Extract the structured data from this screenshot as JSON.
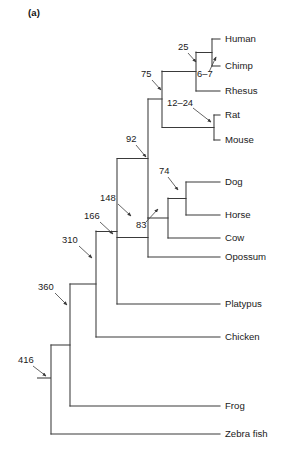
{
  "figure": {
    "panel_label": "(a)",
    "type": "phylogenetic-tree",
    "stroke_color": "#3a3a3a",
    "text_color": "#1a1a1a",
    "background": "#ffffff"
  },
  "tips": [
    {
      "id": "human",
      "label": "Human",
      "x": 225,
      "y": 39,
      "branch_x": 212
    },
    {
      "id": "chimp",
      "label": "Chimp",
      "x": 225,
      "y": 66,
      "branch_x": 212
    },
    {
      "id": "rhesus",
      "label": "Rhesus",
      "x": 225,
      "y": 91,
      "branch_x": 196
    },
    {
      "id": "rat",
      "label": "Rat",
      "x": 225,
      "y": 115,
      "branch_x": 214
    },
    {
      "id": "mouse",
      "label": "Mouse",
      "x": 225,
      "y": 140,
      "branch_x": 214
    },
    {
      "id": "dog",
      "label": "Dog",
      "x": 225,
      "y": 182,
      "branch_x": 186
    },
    {
      "id": "horse",
      "label": "Horse",
      "x": 225,
      "y": 215,
      "branch_x": 186
    },
    {
      "id": "cow",
      "label": "Cow",
      "x": 225,
      "y": 238,
      "branch_x": 168
    },
    {
      "id": "opossum",
      "label": "Opossum",
      "x": 225,
      "y": 257,
      "branch_x": 148
    },
    {
      "id": "platypus",
      "label": "Platypus",
      "x": 225,
      "y": 304,
      "branch_x": 117
    },
    {
      "id": "chicken",
      "label": "Chicken",
      "x": 225,
      "y": 337,
      "branch_x": 96
    },
    {
      "id": "frog",
      "label": "Frog",
      "x": 225,
      "y": 406,
      "branch_x": 70
    },
    {
      "id": "zebrafish",
      "label": "Zebra fish",
      "x": 225,
      "y": 434,
      "branch_x": 51
    }
  ],
  "nodes": [
    {
      "id": "human-chimp",
      "label": "6–7",
      "x": 212,
      "y_top": 39,
      "y_bot": 66,
      "parent_x": 196
    },
    {
      "id": "catarrhini",
      "label": "25",
      "x": 196,
      "y_top": 52,
      "y_bot": 91,
      "parent_x": 162
    },
    {
      "id": "rat-mouse",
      "label": "12–24",
      "x": 214,
      "y_top": 115,
      "y_bot": 140,
      "parent_x": 162
    },
    {
      "id": "euarchonto",
      "label": "75",
      "x": 162,
      "y_top": 71,
      "y_bot": 127,
      "parent_x": 148
    },
    {
      "id": "dog-horse",
      "label": "74",
      "x": 186,
      "y_top": 182,
      "y_bot": 215,
      "parent_x": 168
    },
    {
      "id": "laurasiatheria",
      "label": "83",
      "x": 168,
      "y_top": 198,
      "y_bot": 238,
      "parent_x": 148
    },
    {
      "id": "boreoeutheria",
      "label": "92",
      "x": 148,
      "y_top": 99,
      "y_bot": 218,
      "parent_x": 117
    },
    {
      "id": "eutheria",
      "label": "148",
      "x": 148,
      "y_top": 218,
      "y_bot": 257,
      "parent_x": 117
    },
    {
      "id": "theria",
      "label": "166",
      "x": 117,
      "y_top": 159,
      "y_bot": 304,
      "parent_x": 96
    },
    {
      "id": "mammalia",
      "label": "310",
      "x": 96,
      "y_top": 231,
      "y_bot": 337,
      "parent_x": 70
    },
    {
      "id": "amniota",
      "label": "360",
      "x": 70,
      "y_top": 284,
      "y_bot": 406,
      "parent_x": 51
    },
    {
      "id": "vertebrata",
      "label": "416",
      "x": 51,
      "y_top": 345,
      "y_bot": 434,
      "parent_x": null
    }
  ],
  "node_labels": [
    {
      "id": "label-25",
      "text": "25",
      "tx": 178,
      "ty": 48,
      "lx1": 188,
      "ly1": 53,
      "lx2": 196,
      "ly2": 62
    },
    {
      "id": "label-6-7",
      "text": "6–7",
      "tx": 197,
      "ty": 75,
      "lx1": 209,
      "ly1": 72,
      "lx2": 216,
      "ly2": 57
    },
    {
      "id": "label-75",
      "text": "75",
      "tx": 141,
      "ty": 75,
      "lx1": 152,
      "ly1": 80,
      "lx2": 161,
      "ly2": 90
    },
    {
      "id": "label-12-24",
      "text": "12–24",
      "tx": 167,
      "ty": 104,
      "lx1": 193,
      "ly1": 108,
      "lx2": 211,
      "ly2": 122
    },
    {
      "id": "label-92",
      "text": "92",
      "tx": 126,
      "ty": 140,
      "lx1": 136,
      "ly1": 145,
      "lx2": 146,
      "ly2": 157
    },
    {
      "id": "label-74",
      "text": "74",
      "tx": 159,
      "ty": 172,
      "lx1": 168,
      "ly1": 177,
      "lx2": 178,
      "ly2": 190
    },
    {
      "id": "label-148",
      "text": "148",
      "tx": 100,
      "ty": 199,
      "lx1": 118,
      "ly1": 204,
      "lx2": 131,
      "ly2": 216
    },
    {
      "id": "label-83",
      "text": "83",
      "tx": 136,
      "ty": 226,
      "lx1": 146,
      "ly1": 222,
      "lx2": 158,
      "ly2": 209
    },
    {
      "id": "label-166",
      "text": "166",
      "tx": 84,
      "ty": 217,
      "lx1": 100,
      "ly1": 222,
      "lx2": 113,
      "ly2": 234
    },
    {
      "id": "label-310",
      "text": "310",
      "tx": 62,
      "ty": 241,
      "lx1": 79,
      "ly1": 246,
      "lx2": 92,
      "ly2": 258
    },
    {
      "id": "label-360",
      "text": "360",
      "tx": 38,
      "ty": 288,
      "lx1": 55,
      "ly1": 293,
      "lx2": 67,
      "ly2": 305
    },
    {
      "id": "label-416",
      "text": "416",
      "tx": 18,
      "ty": 361,
      "lx1": 33,
      "ly1": 366,
      "lx2": 46,
      "ly2": 376
    }
  ],
  "root_stub": {
    "x1": 37,
    "x2": 51,
    "y": 378
  }
}
